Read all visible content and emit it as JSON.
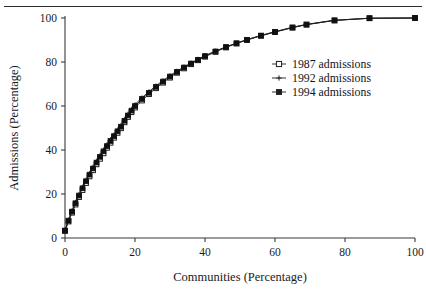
{
  "figure": {
    "has_top_rule": true,
    "background": "#ffffff",
    "ink_color": "#1d1d1d"
  },
  "chart_data": {
    "type": "line",
    "title": "",
    "xlabel": "Communities (Percentage)",
    "ylabel": "Admissions (Percentage)",
    "xlim": [
      0,
      100
    ],
    "ylim": [
      0,
      100
    ],
    "xticks": [
      0,
      20,
      40,
      60,
      80,
      100
    ],
    "yticks": [
      0,
      20,
      40,
      60,
      80,
      100
    ],
    "xticklabels": [
      "0",
      "20",
      "40",
      "60",
      "80",
      "100"
    ],
    "yticklabels": [
      "0",
      "20",
      "40",
      "60",
      "80",
      "100"
    ],
    "grid": false,
    "legend_position": "center-right",
    "series": [
      {
        "name": "1987 admissions",
        "marker": "open-square",
        "color": "#1d1d1d",
        "x": [
          0,
          1,
          2,
          3,
          4,
          5,
          6,
          7,
          8,
          9,
          10,
          11,
          12,
          13,
          14,
          15,
          16,
          17,
          18,
          19,
          20,
          22,
          24,
          26,
          28,
          30,
          32,
          34,
          36,
          38,
          40,
          43,
          46,
          49,
          52,
          56,
          60,
          65,
          69,
          77,
          87,
          100
        ],
        "y": [
          3.2,
          7.5,
          11.5,
          15.2,
          18.6,
          21.8,
          25.0,
          28.0,
          30.8,
          33.5,
          36.0,
          38.5,
          41.0,
          43.3,
          45.6,
          47.8,
          49.9,
          52.6,
          55.0,
          57.2,
          59.3,
          62.5,
          65.4,
          68.1,
          70.6,
          72.9,
          75.1,
          77.1,
          79.0,
          80.8,
          82.4,
          84.6,
          86.6,
          88.4,
          90.0,
          91.9,
          93.6,
          95.6,
          97.0,
          98.9,
          99.9,
          100.0
        ]
      },
      {
        "name": "1992 admissions",
        "marker": "cross",
        "color": "#4d4d4d",
        "x": [
          0,
          1,
          2,
          3,
          4,
          5,
          6,
          7,
          8,
          9,
          10,
          11,
          12,
          13,
          14,
          15,
          16,
          17,
          18,
          19,
          20,
          22,
          24,
          26,
          28,
          30,
          32,
          34,
          36,
          38,
          40,
          43,
          46,
          49,
          52,
          56,
          60,
          65,
          69,
          77,
          87,
          100
        ],
        "y": [
          3.6,
          8.2,
          12.4,
          16.3,
          19.9,
          23.2,
          26.4,
          29.4,
          32.3,
          35.0,
          37.6,
          40.1,
          42.5,
          44.8,
          47.0,
          49.2,
          51.3,
          54.0,
          56.4,
          58.6,
          60.7,
          63.8,
          66.6,
          69.2,
          71.6,
          73.8,
          75.9,
          77.8,
          79.6,
          81.3,
          82.9,
          85.0,
          86.9,
          88.6,
          90.2,
          92.1,
          93.8,
          95.8,
          97.1,
          99.0,
          99.9,
          100.0
        ]
      },
      {
        "name": "1994 admissions",
        "marker": "filled-square",
        "color": "#101010",
        "x": [
          0,
          1,
          2,
          3,
          4,
          5,
          6,
          7,
          8,
          9,
          10,
          11,
          12,
          13,
          14,
          15,
          16,
          17,
          18,
          19,
          20,
          22,
          24,
          26,
          28,
          30,
          32,
          34,
          36,
          38,
          40,
          43,
          46,
          49,
          52,
          56,
          60,
          65,
          69,
          77,
          87,
          100
        ],
        "y": [
          3.4,
          7.9,
          12.0,
          15.8,
          19.3,
          22.6,
          25.8,
          28.8,
          31.6,
          34.3,
          36.9,
          39.4,
          41.8,
          44.1,
          46.3,
          48.5,
          50.6,
          53.3,
          55.7,
          57.9,
          60.0,
          63.2,
          66.0,
          68.7,
          71.1,
          73.4,
          75.5,
          77.5,
          79.3,
          81.0,
          82.7,
          84.8,
          86.8,
          88.5,
          90.1,
          92.0,
          93.7,
          95.7,
          97.0,
          98.9,
          99.9,
          100.0
        ]
      }
    ]
  },
  "legend": {
    "items": [
      {
        "label": "1987 admissions",
        "marker": "open-square"
      },
      {
        "label": "1992 admissions",
        "marker": "cross"
      },
      {
        "label": "1994 admissions",
        "marker": "filled-square"
      }
    ]
  }
}
